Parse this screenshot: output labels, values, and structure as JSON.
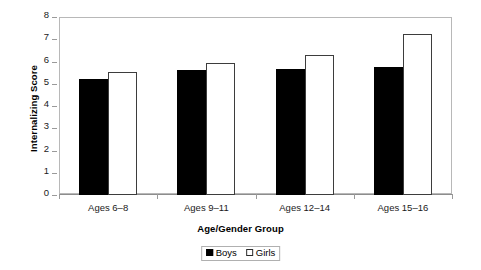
{
  "chart_data": {
    "type": "bar",
    "title": "",
    "xlabel": "Age/Gender Group",
    "ylabel": "Internalizing Score",
    "categories": [
      "Ages 6–8",
      "Ages 9–11",
      "Ages 12–14",
      "Ages 15–16"
    ],
    "series": [
      {
        "name": "Boys",
        "color": "#000000",
        "values": [
          5.2,
          5.6,
          5.65,
          5.75
        ]
      },
      {
        "name": "Girls",
        "color": "#ffffff",
        "values": [
          5.55,
          5.95,
          6.3,
          7.25
        ]
      }
    ],
    "ylim": [
      0,
      8
    ],
    "yticks": [
      0,
      1,
      2,
      3,
      4,
      5,
      6,
      7,
      8
    ],
    "ytick_labels": [
      "0",
      "1",
      "2",
      "3",
      "4",
      "5",
      "6",
      "7",
      "8"
    ],
    "grid": false,
    "legend_position": "bottom-center",
    "legend_entries": [
      "Boys",
      "Girls"
    ],
    "frame_color": "#b8b8b8",
    "axis_color": "#8d8d8d"
  }
}
